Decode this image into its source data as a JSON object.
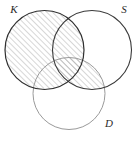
{
  "figure": {
    "type": "venn-diagram",
    "background_color": "#ffffff",
    "width": 140,
    "height": 141
  },
  "sets": [
    {
      "id": "K",
      "label": "K",
      "label_x": 14,
      "label_y": 13,
      "cx": 44.5,
      "cy": 50,
      "r": 39.5,
      "stroke": "#2f2f2f",
      "stroke_width": 1.2
    },
    {
      "id": "S",
      "label": "S",
      "label_x": 124,
      "label_y": 13,
      "cx": 92,
      "cy": 50,
      "r": 39.5,
      "stroke": "#3a3a3a",
      "stroke_width": 1.1
    },
    {
      "id": "D",
      "label": "D",
      "label_x": 109,
      "label_y": 127,
      "cx": 69,
      "cy": 93.5,
      "r": 36,
      "stroke": "#9a9a9a",
      "stroke_width": 1.0
    }
  ],
  "shading": {
    "description": "Hatched region: all of K, plus the intersection of S and D",
    "regions": [
      "K",
      "S-and-D"
    ],
    "pattern": "diagonal-hatch-45",
    "hatch_color": "#8c8c8c",
    "hatch_spacing_px": 4,
    "hatch_stroke_width": 0.7,
    "hatch_angle_deg": 45
  },
  "colors": {
    "background": "#ffffff",
    "primary_stroke": "#2f2f2f",
    "secondary_stroke": "#3a3a3a",
    "light_stroke": "#9a9a9a",
    "hatch": "#8c8c8c",
    "label_text": "#2a2a2a"
  }
}
